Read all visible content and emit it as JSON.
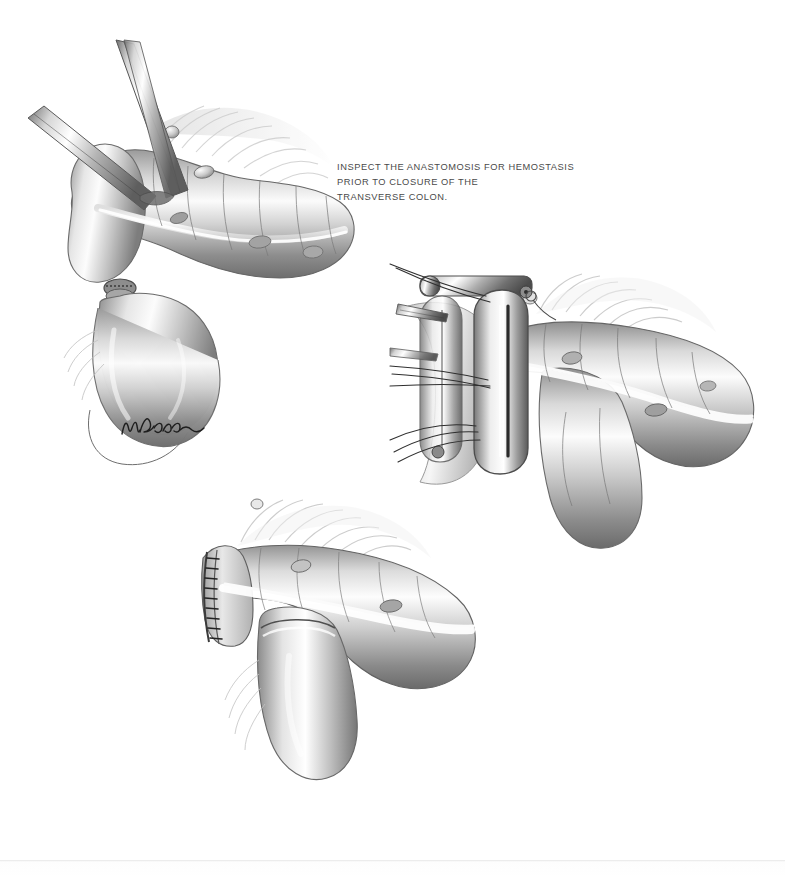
{
  "page": {
    "kind": "scanned-medical-illustration-page",
    "background_color": "#ffffff",
    "ink_color": "#4a4a4a",
    "edge_line_color": "#e2e2e2"
  },
  "caption": {
    "line1": "INSPECT THE ANASTOMOSIS FOR HEMOSTASIS",
    "line2": "PRIOR TO CLOSURE OF THE",
    "line3": "TRANSVERSE COLON."
  },
  "figures": [
    {
      "id": "fig-top-left",
      "name": "transverse-colon-with-clamps-and-efferent-limb",
      "description": "Transverse colon held by two forceps at the left end, with the anastomosed small bowel limb looping downward; epiploic appendages and taenia coli visible.",
      "parts": [
        "forceps-upper",
        "forceps-lower",
        "colon-segment",
        "taenia-coli",
        "haustra",
        "epiploic-appendages",
        "mesentery-fringe",
        "anastomosis-stump",
        "efferent-bowel-limb"
      ]
    },
    {
      "id": "fig-mid-right",
      "name": "linear-stapler-applied-to-colotomy",
      "description": "Linear (TA type) surgical stapler clamped across the open colotomy with traction sutures radiating to the left; colon curves to the right with attached small bowel limb descending.",
      "parts": [
        "linear-stapler-body",
        "stapler-anvil",
        "stapler-pivot-pin",
        "traction-sutures",
        "forceps-tip",
        "colon-segment",
        "taenia-coli",
        "epiploic-appendages",
        "descending-bowel-limb"
      ]
    },
    {
      "id": "fig-bottom",
      "name": "completed-stapled-anastomosis",
      "description": "Completed side-to-side anastomosis showing the transverse staple line closing the colon end, with the bowel limb joined below.",
      "parts": [
        "staple-line",
        "colon-segment",
        "taenia-coli",
        "haustra",
        "epiploic-appendages",
        "anastomosed-bowel-limb"
      ]
    }
  ],
  "signature": {
    "name": "artist-signature",
    "text": "Baker",
    "style": "cursive-handwritten"
  }
}
